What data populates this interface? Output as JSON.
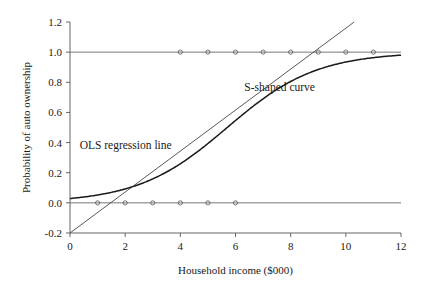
{
  "chart_data": {
    "type": "line",
    "title": "",
    "xlabel": "Household income ($000)",
    "ylabel": "Probability of auto ownership",
    "xlim": [
      0,
      12
    ],
    "ylim": [
      -0.2,
      1.2
    ],
    "grid": false,
    "legend_position": "inline-annotations",
    "xticks": [
      0,
      2,
      4,
      6,
      8,
      10,
      12
    ],
    "xtick_labels": [
      "0",
      "2",
      "4",
      "6",
      "8",
      "10",
      "12"
    ],
    "yticks": [
      -0.2,
      0.0,
      0.2,
      0.4,
      0.6,
      0.8,
      1.0,
      1.2
    ],
    "ytick_labels": [
      "-0.2",
      "0.0",
      "0.2",
      "0.4",
      "0.6",
      "0.8",
      "1.0",
      "1.2"
    ],
    "reference_lines": [
      {
        "name": "y-equals-one",
        "y": 1.0,
        "x_from": 0,
        "x_to": 12
      },
      {
        "name": "y-equals-zero",
        "y": 0.0,
        "x_from": 0,
        "x_to": 12
      }
    ],
    "series": [
      {
        "name": "OLS regression line",
        "type": "line",
        "annotation": "OLS regression line",
        "annotation_xy": [
          0.35,
          0.36
        ],
        "x": [
          0,
          10.3
        ],
        "y": [
          -0.2,
          1.2
        ],
        "intercept": -0.2,
        "slope": 0.136
      },
      {
        "name": "S-shaped curve",
        "type": "line",
        "annotation": "S-shaped curve",
        "annotation_xy": [
          7.6,
          0.74
        ],
        "description": "logistic curve",
        "logistic_midpoint": 5.7,
        "logistic_scale": 1.62,
        "x": [
          0,
          0.5,
          1,
          1.5,
          2,
          2.5,
          3,
          3.5,
          4,
          4.5,
          5,
          5.5,
          6,
          6.5,
          7,
          7.5,
          8,
          8.5,
          9,
          9.5,
          10,
          10.5,
          11,
          11.5,
          12
        ],
        "y": [
          0.029,
          0.039,
          0.053,
          0.071,
          0.094,
          0.124,
          0.162,
          0.209,
          0.266,
          0.331,
          0.404,
          0.481,
          0.559,
          0.634,
          0.702,
          0.762,
          0.813,
          0.855,
          0.889,
          0.916,
          0.936,
          0.952,
          0.964,
          0.973,
          0.979
        ]
      },
      {
        "name": "observed points at probability one",
        "type": "scatter",
        "x": [
          4,
          5,
          6,
          7,
          8,
          9,
          10,
          11
        ],
        "y": [
          1.0,
          1.0,
          1.0,
          1.0,
          1.0,
          1.0,
          1.0,
          1.0
        ]
      },
      {
        "name": "observed points at probability zero",
        "type": "scatter",
        "x": [
          1,
          2,
          3,
          4,
          5,
          6
        ],
        "y": [
          0.0,
          0.0,
          0.0,
          0.0,
          0.0,
          0.0
        ]
      }
    ],
    "annotations": [
      {
        "text": "OLS regression line",
        "x": 0.35,
        "y": 0.36
      },
      {
        "text": "S-shaped curve",
        "x": 7.6,
        "y": 0.74
      }
    ],
    "colors": {
      "background": "#ffffff",
      "axis": "#555555",
      "ols_line": "#444444",
      "s_curve": "#1a1a1a",
      "reference_line": "#666666",
      "marker_stroke": "#555555",
      "text": "#1a1a1a"
    }
  }
}
